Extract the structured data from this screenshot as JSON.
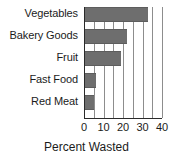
{
  "chart_data": {
    "type": "bar",
    "orientation": "horizontal",
    "title": "",
    "xlabel": "Percent Wasted",
    "ylabel": "",
    "categories": [
      "Vegetables",
      "Bakery Goods",
      "Fruit",
      "Fast Food",
      "Red Meat"
    ],
    "values": [
      33,
      22,
      19,
      6,
      5
    ],
    "xlim": [
      0,
      40
    ],
    "xticks": [
      0,
      10,
      20,
      30,
      40
    ],
    "xtick_labels": [
      "0",
      "10",
      "20",
      "30",
      "40"
    ],
    "gridlines": [
      0,
      5,
      10,
      15,
      20,
      25,
      30,
      35,
      40
    ],
    "grid": true,
    "legend": false,
    "bar_color": "#6e6e6e",
    "axis_color": "#2a2a2a",
    "grid_color": "#8d8d8d",
    "text_color": "#1b1b1b",
    "background": "#ffffff"
  }
}
